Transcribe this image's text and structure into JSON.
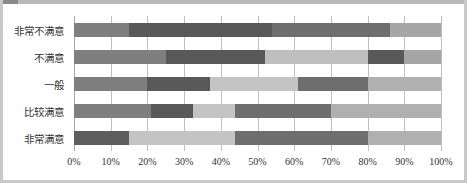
{
  "chart_data": {
    "type": "bar",
    "orientation": "horizontal",
    "stacked": "100%",
    "title": "",
    "xlabel": "",
    "ylabel": "",
    "xlim": [
      0,
      100
    ],
    "grid": true,
    "legend": "none",
    "categories": [
      "非常不满意",
      "不满意",
      "一般",
      "比较满意",
      "非常满意"
    ],
    "tick_labels": [
      "0%",
      "10%",
      "20%",
      "30%",
      "40%",
      "50%",
      "60%",
      "70%",
      "80%",
      "90%",
      "100%"
    ],
    "tick_values": [
      0,
      10,
      20,
      30,
      40,
      50,
      60,
      70,
      80,
      90,
      100
    ],
    "colors": {
      "s1": "#7f7f7f",
      "s2": "#595959",
      "s3": "#bfbfbf",
      "s4": "#808080",
      "s5": "#a6a6a6"
    },
    "rows": [
      {
        "category": "非常不满意",
        "segments": [
          {
            "series": "s1",
            "start": 0,
            "end": 15,
            "value": 15,
            "color": "#7f7f7f"
          },
          {
            "series": "s2",
            "start": 15,
            "end": 54,
            "value": 39,
            "color": "#595959"
          },
          {
            "series": "s4",
            "start": 54,
            "end": 86,
            "value": 32,
            "color": "#6e6e6e"
          },
          {
            "series": "s5",
            "start": 86,
            "end": 100,
            "value": 14,
            "color": "#a6a6a6"
          }
        ]
      },
      {
        "category": "不满意",
        "segments": [
          {
            "series": "s1",
            "start": 0,
            "end": 25,
            "value": 25,
            "color": "#7f7f7f"
          },
          {
            "series": "s2",
            "start": 25,
            "end": 52,
            "value": 27,
            "color": "#595959"
          },
          {
            "series": "s3",
            "start": 52,
            "end": 80,
            "value": 28,
            "color": "#bfbfbf"
          },
          {
            "series": "s2",
            "start": 80,
            "end": 90,
            "value": 10,
            "color": "#595959"
          },
          {
            "series": "s5",
            "start": 90,
            "end": 100,
            "value": 10,
            "color": "#a6a6a6"
          }
        ]
      },
      {
        "category": "一般",
        "segments": [
          {
            "series": "s1",
            "start": 0,
            "end": 20,
            "value": 20,
            "color": "#7f7f7f"
          },
          {
            "series": "s2",
            "start": 20,
            "end": 37,
            "value": 17,
            "color": "#595959"
          },
          {
            "series": "s3",
            "start": 37,
            "end": 61,
            "value": 24,
            "color": "#c4c4c4"
          },
          {
            "series": "s4",
            "start": 61,
            "end": 80,
            "value": 19,
            "color": "#6e6e6e"
          },
          {
            "series": "s5",
            "start": 80,
            "end": 100,
            "value": 20,
            "color": "#b0b0b0"
          }
        ]
      },
      {
        "category": "比较满意",
        "segments": [
          {
            "series": "s1",
            "start": 0,
            "end": 21,
            "value": 21,
            "color": "#7f7f7f"
          },
          {
            "series": "s2",
            "start": 21,
            "end": 32.5,
            "value": 11.5,
            "color": "#595959"
          },
          {
            "series": "s3",
            "start": 32.5,
            "end": 44,
            "value": 11.5,
            "color": "#c4c4c4"
          },
          {
            "series": "s4",
            "start": 44,
            "end": 70,
            "value": 26,
            "color": "#6e6e6e"
          },
          {
            "series": "s5",
            "start": 70,
            "end": 100,
            "value": 30,
            "color": "#b0b0b0"
          }
        ]
      },
      {
        "category": "非常满意",
        "segments": [
          {
            "series": "s2",
            "start": 0,
            "end": 15,
            "value": 15,
            "color": "#5e5e5e"
          },
          {
            "series": "s3",
            "start": 15,
            "end": 44,
            "value": 29,
            "color": "#c4c4c4"
          },
          {
            "series": "s4",
            "start": 44,
            "end": 80,
            "value": 36,
            "color": "#6e6e6e"
          },
          {
            "series": "s5",
            "start": 80,
            "end": 100,
            "value": 20,
            "color": "#b0b0b0"
          }
        ]
      }
    ]
  }
}
